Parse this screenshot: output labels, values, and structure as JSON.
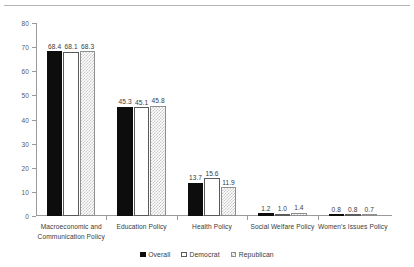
{
  "chart_data": {
    "type": "bar",
    "title": "",
    "xlabel": "",
    "ylabel": "",
    "ylim": [
      0,
      80
    ],
    "yticks": [
      0,
      10,
      20,
      30,
      40,
      50,
      60,
      70,
      80
    ],
    "grid": false,
    "legend_position": "bottom-center",
    "categories": [
      "Macroeconomic and\nCommunication Policy",
      "Education Policy",
      "Health Policy",
      "Social Welfare Policy",
      "Women's Issues Policy"
    ],
    "series": [
      {
        "name": "Overall",
        "style": "solid-black",
        "color": "#0d0d0d",
        "values": [
          68.4,
          45.3,
          13.7,
          1.2,
          0.8
        ],
        "labels": [
          "68.4",
          "45.3",
          "13.7",
          "1.2",
          "0.8"
        ]
      },
      {
        "name": "Democrat",
        "style": "outline-white",
        "color": "#ffffff",
        "values": [
          68.1,
          45.1,
          15.6,
          1.0,
          0.8
        ],
        "labels": [
          "68.1",
          "45.1",
          "15.6",
          "1.0",
          "0.8"
        ]
      },
      {
        "name": "Republican",
        "style": "checkered-gray",
        "color": "#c9c9c9",
        "values": [
          68.3,
          45.8,
          11.9,
          1.4,
          0.7
        ],
        "labels": [
          "68.3",
          "45.8",
          "11.9",
          "1.4",
          "0.7"
        ]
      }
    ]
  }
}
